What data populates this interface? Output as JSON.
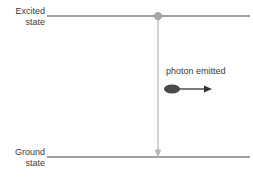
{
  "diagram": {
    "background_color": "#ffffff",
    "labels": {
      "excited_state_line1": "Excited",
      "excited_state_line2": "state",
      "ground_state_line1": "Ground",
      "ground_state_line2": "state",
      "photon_emitted": "photon emitted"
    },
    "colors": {
      "energy_level_line": "#808080",
      "transition_arrow": "#b0b0b0",
      "electron_marker": "#a0a0a0",
      "photon_body": "#4a4a4a",
      "photon_arrow": "#333333",
      "text": "#3a3a3a"
    },
    "geometry": {
      "excited_state_line_y": 16,
      "ground_state_line_y": 157,
      "line_x_start": 47,
      "line_x_end": 250,
      "transition_x": 158,
      "electron_marker_radius": 3.6,
      "photon_ellipse_cx": 172,
      "photon_ellipse_cy": 89,
      "photon_ellipse_rx": 8,
      "photon_ellipse_ry": 4.5,
      "photon_arrow_x_start": 180,
      "photon_arrow_x_end": 210,
      "photon_arrow_y": 89
    }
  }
}
